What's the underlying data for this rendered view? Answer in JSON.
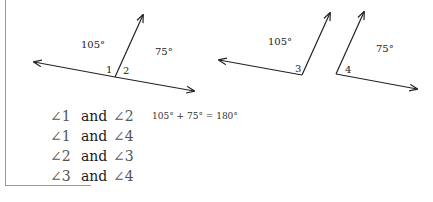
{
  "figure1": {
    "angle_left_label": "105°",
    "angle_right_label": "75°",
    "num_1": "1",
    "num_2": "2"
  },
  "figure2": {
    "angle_label": "105°",
    "num": "3"
  },
  "figure3": {
    "angle_label": "75°",
    "num": "4"
  },
  "pairs": [
    {
      "a": "∠1",
      "conj": "and",
      "b": "∠2"
    },
    {
      "a": "∠1",
      "conj": "and",
      "b": "∠4"
    },
    {
      "a": "∠2",
      "conj": "and",
      "b": "∠3"
    },
    {
      "a": "∠3",
      "conj": "and",
      "b": "∠4"
    }
  ],
  "equation": "105° + 75° = 180°"
}
